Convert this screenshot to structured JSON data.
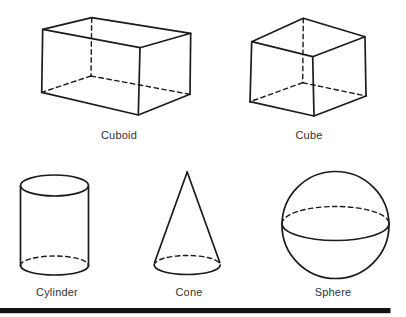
{
  "figure": {
    "shapes": [
      {
        "id": "cuboid",
        "label": "Cuboid"
      },
      {
        "id": "cube",
        "label": "Cube"
      },
      {
        "id": "cylinder",
        "label": "Cylinder"
      },
      {
        "id": "cone",
        "label": "Cone"
      },
      {
        "id": "sphere",
        "label": "Sphere"
      }
    ],
    "colors": {
      "background": "#ffffff",
      "stroke": "#1b1b1b",
      "label_text": "#323232",
      "bottom_rule": "#151515"
    }
  }
}
